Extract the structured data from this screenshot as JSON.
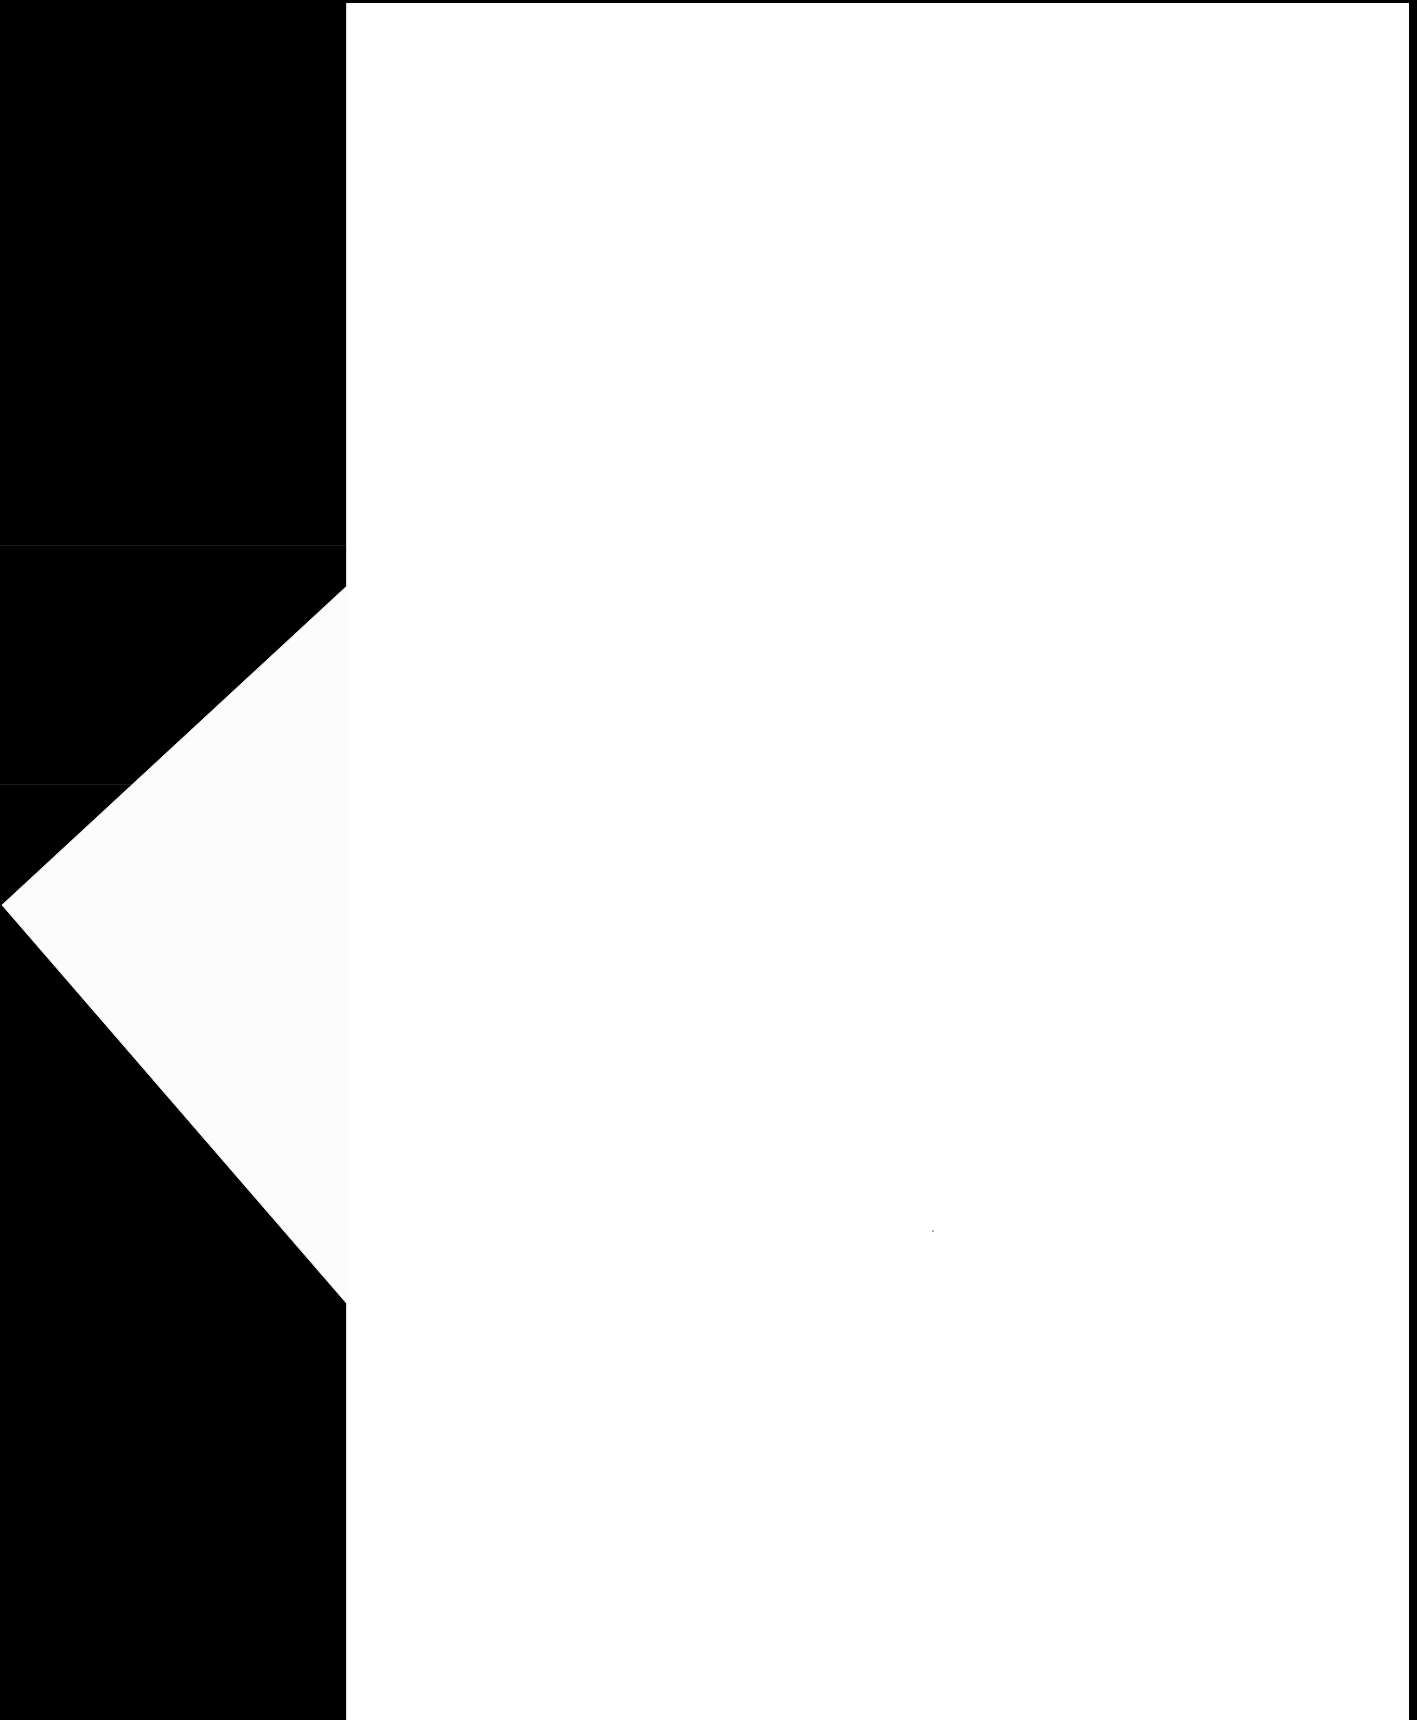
{
  "document": {
    "type": "scanned-page",
    "content_text": "",
    "colors": {
      "scanner_background": "#000000",
      "paper": "#ffffff",
      "fold_flap": "#fcfcfc",
      "fold_shadow": "#eeeeee"
    }
  }
}
